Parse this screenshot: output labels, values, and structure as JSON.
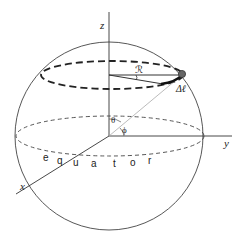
{
  "figure": {
    "type": "spherical-coordinates-diagram"
  },
  "axes": {
    "x_label": "x",
    "y_label": "y",
    "z_label": "z"
  },
  "labels": {
    "radius": "ℛ",
    "arc_length": "Δℓ",
    "theta": "θ",
    "phi": "ϕ",
    "equator_letters": [
      "e",
      "q",
      "u",
      "a",
      "t",
      "o",
      "r"
    ]
  },
  "colors": {
    "line": "#333333",
    "guide": "#999999",
    "point": "#555555"
  }
}
